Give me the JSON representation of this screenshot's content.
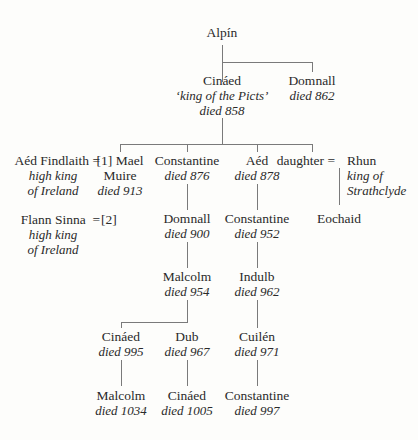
{
  "tree": {
    "alpin": {
      "name": "Alpín"
    },
    "cinaed1": {
      "name": "Cináed",
      "title": "‘king of the Picts’",
      "died": "died 858"
    },
    "domnall1": {
      "name": "Domnall",
      "died": "died 862"
    },
    "aed_findlaith": {
      "name": "Aéd Findlaith =",
      "title1": "high king",
      "title2": "of Ireland"
    },
    "mael_muire": {
      "name": "[1] Mael",
      "name2": "Muire",
      "died": "died 913"
    },
    "flann_sinna": {
      "name": "Flann Sinna  =",
      "title1": "high king",
      "title2": "of Ireland"
    },
    "marriage2": {
      "label": "[2]"
    },
    "constantine1": {
      "name": "Constantine",
      "died": "died 876"
    },
    "aed": {
      "name": "Aéd",
      "died": "died 878"
    },
    "daughter": {
      "name": "daughter ="
    },
    "rhun": {
      "name": "Rhun",
      "title1": "king of",
      "title2": "Strathclyde"
    },
    "eochaid": {
      "name": "Eochaid"
    },
    "domnall2": {
      "name": "Domnall",
      "died": "died 900"
    },
    "constantine2": {
      "name": "Constantine",
      "died": "died 952"
    },
    "malcolm1": {
      "name": "Malcolm",
      "died": "died 954"
    },
    "indulb": {
      "name": "Indulb",
      "died": "died 962"
    },
    "cinaed2": {
      "name": "Cináed",
      "died": "died 995"
    },
    "dub": {
      "name": "Dub",
      "died": "died 967"
    },
    "cuilen": {
      "name": "Cuilén",
      "died": "died 971"
    },
    "malcolm2": {
      "name": "Malcolm",
      "died": "died 1034"
    },
    "cinaed3": {
      "name": "Cináed",
      "died": "died 1005"
    },
    "constantine3": {
      "name": "Constantine",
      "died": "died 997"
    }
  }
}
